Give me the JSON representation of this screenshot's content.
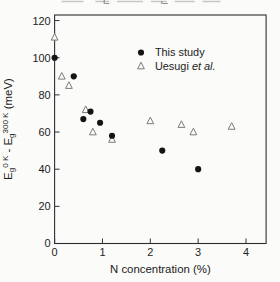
{
  "chart_data": {
    "type": "scatter",
    "title": "",
    "xlabel": "N concentration (%)",
    "ylabel_plain": "Eg 0 K - Eg 300 K (meV)",
    "ylabel_parts": {
      "base1": "E",
      "sub1": "g",
      "sup1": "0 K",
      "sep": " - ",
      "base2": "E",
      "sub2": "g",
      "sup2": "300 K",
      "suffix": " (meV)"
    },
    "xlim": [
      0,
      4.42
    ],
    "ylim": [
      0,
      123
    ],
    "xticks": [
      0,
      1,
      2,
      3,
      4
    ],
    "yticks": [
      0,
      20,
      40,
      60,
      80,
      100,
      120
    ],
    "grid": false,
    "legend_position": "top-right",
    "series": [
      {
        "name": "This study",
        "name_italic": "",
        "marker": "filled-circle",
        "color": "#141414",
        "points": [
          [
            0,
            100
          ],
          [
            0.4,
            90
          ],
          [
            0.6,
            67
          ],
          [
            0.75,
            71
          ],
          [
            0.95,
            65
          ],
          [
            1.2,
            58
          ],
          [
            2.25,
            50
          ],
          [
            3.0,
            40
          ]
        ]
      },
      {
        "name": "Uesugi ",
        "name_italic": "et al.",
        "marker": "open-triangle",
        "color": "#7a7a7a",
        "points": [
          [
            0,
            111
          ],
          [
            0.15,
            90
          ],
          [
            0.3,
            85
          ],
          [
            0.65,
            72
          ],
          [
            0.8,
            60
          ],
          [
            1.2,
            56
          ],
          [
            2.0,
            66
          ],
          [
            2.65,
            64
          ],
          [
            2.9,
            60
          ],
          [
            3.7,
            63
          ]
        ]
      }
    ]
  },
  "colors": {
    "frame": "#2e2e2e",
    "text": "#1c1c1c",
    "background": "#fbfbf9",
    "fragment": "#b9b9b4"
  }
}
